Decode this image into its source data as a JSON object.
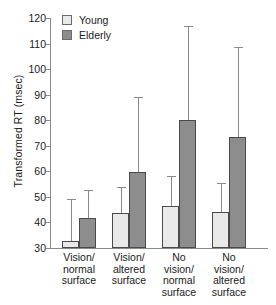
{
  "chart_data": {
    "type": "bar",
    "title": "",
    "xlabel": "",
    "ylabel": "Transformed RT (msec)",
    "ylim": [
      30,
      120
    ],
    "yticks": [
      30,
      40,
      50,
      60,
      70,
      80,
      90,
      100,
      110,
      120
    ],
    "ytick_labels": [
      "30",
      "40",
      "50",
      "60",
      "70",
      "80",
      "90",
      "100",
      "110",
      "120"
    ],
    "grid": false,
    "legend_position": "top-left",
    "categories": [
      "Vision/ normal surface",
      "Vision/ altered surface",
      "No vision/ normal surface",
      "No vision/ altered surface"
    ],
    "category_lines": [
      [
        "Vision/",
        "normal",
        "surface"
      ],
      [
        "Vision/",
        "altered",
        "surface"
      ],
      [
        "No",
        "vision/",
        "normal",
        "surface"
      ],
      [
        "No",
        "vision/",
        "altered",
        "surface"
      ]
    ],
    "series": [
      {
        "name": "Young",
        "color": "#e9e9e9",
        "values": [
          32.7,
          43.8,
          46.6,
          44.0
        ],
        "error_upper": [
          49.2,
          53.9,
          58.2,
          55.5
        ]
      },
      {
        "name": "Elderly",
        "color": "#8d8d8d",
        "values": [
          41.7,
          59.7,
          80.2,
          73.3
        ],
        "error_upper": [
          52.7,
          89.0,
          117.0,
          108.5
        ]
      }
    ]
  },
  "legend": {
    "items": [
      {
        "label": "Young"
      },
      {
        "label": "Elderly"
      }
    ]
  }
}
